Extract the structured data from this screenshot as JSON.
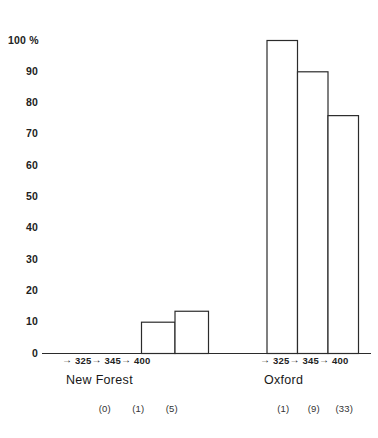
{
  "chart_data": {
    "type": "bar",
    "title": "",
    "subtitle": "",
    "xlabel": "",
    "ylabel": "",
    "ylim": [
      0,
      100
    ],
    "y_unit": "%",
    "grid": false,
    "legend": "none",
    "y_ticks": [
      {
        "value": 100,
        "label": "100",
        "suffix": "%"
      },
      {
        "value": 90,
        "label": "90",
        "suffix": ""
      },
      {
        "value": 80,
        "label": "80",
        "suffix": ""
      },
      {
        "value": 70,
        "label": "70",
        "suffix": ""
      },
      {
        "value": 60,
        "label": "60",
        "suffix": ""
      },
      {
        "value": 50,
        "label": "50",
        "suffix": ""
      },
      {
        "value": 40,
        "label": "40",
        "suffix": ""
      },
      {
        "value": 30,
        "label": "30",
        "suffix": ""
      },
      {
        "value": 20,
        "label": "20",
        "suffix": ""
      },
      {
        "value": 10,
        "label": "10",
        "suffix": ""
      },
      {
        "value": 0,
        "label": "0",
        "suffix": ""
      }
    ],
    "groups": [
      {
        "name": "New Forest",
        "label": "New Forest",
        "categories": [
          "325",
          "345",
          "400"
        ],
        "tick_arrow": "→",
        "values": [
          0,
          10,
          13.5
        ],
        "counts": [
          "(0)",
          "(1)",
          "(5)"
        ]
      },
      {
        "name": "Oxford",
        "label": "Oxford",
        "categories": [
          "325",
          "345",
          "400"
        ],
        "tick_arrow": "→",
        "values": [
          100,
          90,
          76
        ],
        "counts": [
          "(1)",
          "(9)",
          "(33)"
        ]
      }
    ],
    "colors": {
      "bar_fill": "#ffffff",
      "bar_stroke": "#2b2b2b",
      "axis": "#2b2b2b",
      "text": "#1a1a1a",
      "background": "#ffffff"
    }
  }
}
